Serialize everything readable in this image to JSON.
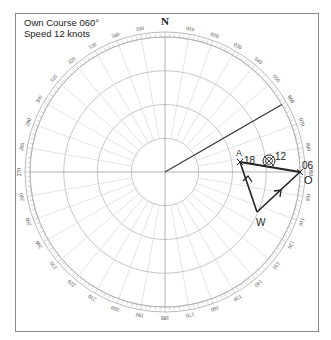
{
  "caption": {
    "line1": "Own Course 060°",
    "line2": "Speed 12 knots"
  },
  "compass": {
    "north_label": "N",
    "bearing_labels": [
      "010",
      "020",
      "030",
      "040",
      "050",
      "060",
      "070",
      "080",
      "090",
      "100",
      "110",
      "120",
      "130",
      "140",
      "150",
      "160",
      "170",
      "180",
      "190",
      "200",
      "210",
      "220",
      "230",
      "240",
      "250",
      "260",
      "270",
      "280",
      "290",
      "300",
      "310",
      "320",
      "330",
      "340",
      "350"
    ],
    "label_interval_deg": 10,
    "range_rings": 4,
    "radial_lines_deg": 10
  },
  "plot": {
    "heading_line_deg": 60,
    "points": {
      "O": {
        "label": "O",
        "time": "06"
      },
      "A": {
        "label": "A",
        "time": "18"
      },
      "W": {
        "label": "W"
      },
      "target": {
        "time": "12"
      }
    },
    "vectors": [
      "W-O",
      "W-A",
      "O-A"
    ]
  },
  "colors": {
    "grid": "#d0d0d0",
    "ring": "#b8b8b8",
    "vector": "#222222",
    "frame": "#8a8a8a"
  }
}
